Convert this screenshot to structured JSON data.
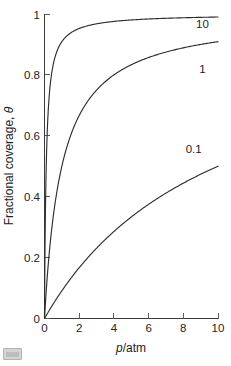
{
  "chart_data": {
    "type": "line",
    "title": "",
    "subtitle": "",
    "xlabel": "p/atm",
    "xlabel_parts": {
      "italic": "p",
      "rest": "/atm"
    },
    "ylabel": "Fractional coverage, θ",
    "ylabel_parts": {
      "text": "Fractional coverage, ",
      "symbol": "θ"
    },
    "xlim": [
      0,
      10
    ],
    "ylim": [
      0,
      1
    ],
    "xticks": [
      0,
      2,
      4,
      6,
      8,
      10
    ],
    "xticklabels": [
      "0",
      "2",
      "4",
      "6",
      "8",
      "10"
    ],
    "yticks": [
      0,
      0.2,
      0.4,
      0.6,
      0.8,
      1
    ],
    "yticklabels": [
      "0",
      "0.2",
      "0.4",
      "0.6",
      "0.8",
      "1"
    ],
    "grid": false,
    "legend_position": "inline-curve-end-labels",
    "annotations": [
      {
        "text": "10",
        "x": 9.1,
        "y": 0.955
      },
      {
        "text": "1",
        "x": 9.1,
        "y": 0.805
      },
      {
        "text": "0.1",
        "x": 8.6,
        "y": 0.545
      }
    ],
    "equation": "θ = Kp / (1 + Kp)",
    "series": [
      {
        "name": "10",
        "K": 10,
        "x": [
          0,
          0.05,
          0.1,
          0.15,
          0.2,
          0.3,
          0.4,
          0.5,
          0.7,
          1,
          1.5,
          2,
          2.5,
          3,
          4,
          5,
          6,
          7,
          8,
          9,
          10
        ],
        "values": [
          0,
          0.333,
          0.5,
          0.6,
          0.667,
          0.75,
          0.8,
          0.833,
          0.875,
          0.909,
          0.938,
          0.952,
          0.962,
          0.968,
          0.976,
          0.98,
          0.984,
          0.986,
          0.988,
          0.989,
          0.99
        ]
      },
      {
        "name": "1",
        "K": 1,
        "x": [
          0,
          0.1,
          0.2,
          0.3,
          0.5,
          0.7,
          1,
          1.5,
          2,
          2.5,
          3,
          4,
          5,
          6,
          7,
          8,
          9,
          10
        ],
        "values": [
          0,
          0.091,
          0.167,
          0.231,
          0.333,
          0.412,
          0.5,
          0.6,
          0.667,
          0.714,
          0.75,
          0.8,
          0.833,
          0.857,
          0.875,
          0.889,
          0.9,
          0.909
        ]
      },
      {
        "name": "0.1",
        "K": 0.1,
        "x": [
          0,
          0.2,
          0.5,
          1,
          1.5,
          2,
          3,
          4,
          5,
          6,
          7,
          8,
          9,
          10
        ],
        "values": [
          0,
          0.02,
          0.048,
          0.091,
          0.13,
          0.167,
          0.231,
          0.286,
          0.333,
          0.375,
          0.412,
          0.444,
          0.474,
          0.5
        ]
      }
    ]
  },
  "figure": {
    "corner_badge_name": "image-placeholder-badge"
  }
}
